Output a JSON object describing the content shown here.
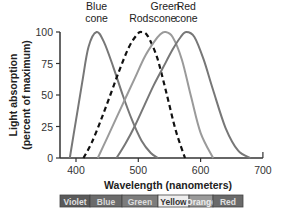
{
  "chart_data": {
    "type": "line",
    "title": "",
    "xlabel": "Wavelength (nanometers)",
    "ylabel": "Light absorption",
    "ylabel_sub": "(percent of maximum)",
    "xlim": [
      375,
      700
    ],
    "ylim": [
      0,
      100
    ],
    "x_ticks": [
      400,
      500,
      600,
      700
    ],
    "y_ticks": [
      0,
      25,
      50,
      75,
      100
    ],
    "grid": false,
    "series": [
      {
        "name": "Blue cone",
        "label_lines": [
          "Blue",
          "cone"
        ],
        "style": "solid",
        "color": "#777777",
        "peak_nm": 433,
        "x": [
          390,
          400,
          410,
          420,
          433,
          445,
          460,
          475,
          490,
          505,
          520,
          532
        ],
        "values": [
          0,
          30,
          60,
          88,
          100,
          92,
          72,
          50,
          30,
          14,
          4,
          0
        ]
      },
      {
        "name": "Rods",
        "label_lines": [
          "Rods"
        ],
        "style": "dashed",
        "color": "#111111",
        "peak_nm": 505,
        "x": [
          412,
          425,
          440,
          455,
          470,
          485,
          498,
          505,
          515,
          530,
          545,
          560,
          575
        ],
        "values": [
          0,
          12,
          30,
          50,
          70,
          88,
          98,
          100,
          97,
          80,
          52,
          22,
          0
        ]
      },
      {
        "name": "Green cone",
        "label_lines": [
          "Green",
          "cone"
        ],
        "style": "solid",
        "color": "#9a9a9a",
        "peak_nm": 543,
        "x": [
          435,
          450,
          465,
          480,
          495,
          510,
          525,
          535,
          543,
          555,
          570,
          585,
          600,
          620
        ],
        "values": [
          0,
          16,
          32,
          48,
          64,
          80,
          92,
          98,
          100,
          96,
          78,
          48,
          20,
          0
        ]
      },
      {
        "name": "Red cone",
        "label_lines": [
          "Red",
          "cone"
        ],
        "style": "solid",
        "color": "#777777",
        "peak_nm": 577,
        "x": [
          465,
          480,
          495,
          510,
          525,
          540,
          555,
          568,
          577,
          590,
          605,
          620,
          640,
          660,
          680
        ],
        "values": [
          0,
          12,
          26,
          42,
          58,
          72,
          86,
          96,
          100,
          96,
          78,
          54,
          24,
          6,
          0
        ]
      }
    ],
    "spectrum_bar": [
      {
        "label": "Violet",
        "from_px": 60,
        "to_px": 90,
        "bg": "#5a5a5a",
        "fg": "#e0e0e0"
      },
      {
        "label": "Blue",
        "from_px": 90,
        "to_px": 122,
        "bg": "#6b6b6b",
        "fg": "#d8d8d8"
      },
      {
        "label": "Green",
        "from_px": 122,
        "to_px": 158,
        "bg": "#7c7c7c",
        "fg": "#dddddd"
      },
      {
        "label": "Yellow",
        "from_px": 158,
        "to_px": 189,
        "bg": "#eeeeee",
        "fg": "#333333"
      },
      {
        "label": "Orange",
        "from_px": 189,
        "to_px": 213,
        "bg": "#9a9a9a",
        "fg": "#eeeeee"
      },
      {
        "label": "Red",
        "from_px": 213,
        "to_px": 243,
        "bg": "#6a6a6a",
        "fg": "#e0e0e0"
      }
    ]
  }
}
